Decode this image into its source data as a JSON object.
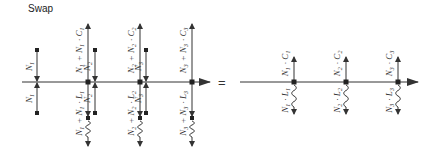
{
  "title": "Swap",
  "equals_sign": "=",
  "colors": {
    "line": "#333333",
    "text": "#333333"
  },
  "left_diagram": {
    "axis": {
      "y": 82,
      "x_start": 22,
      "x_end": 210
    },
    "small_flows": [
      {
        "x": 37,
        "top_label": "N1",
        "bottom_label": "N1"
      },
      {
        "x": 95,
        "top_label": "N2",
        "bottom_label": "N2"
      },
      {
        "x": 146,
        "top_label": "N3",
        "bottom_label": "N3"
      }
    ],
    "main_flows": [
      {
        "x": 88,
        "top_label": "N1 + N1 · C1",
        "bottom_label": "N1 + N1 · L1"
      },
      {
        "x": 140,
        "top_label": "N2 + N2 · C2",
        "bottom_label": "N2 + N2 · L2"
      },
      {
        "x": 192,
        "top_label": "N3 + N3 · C3",
        "bottom_label": "N3 + N3 · L3"
      }
    ]
  },
  "right_diagram": {
    "axis": {
      "y": 82,
      "x_start": 240,
      "x_end": 418
    },
    "flows": [
      {
        "x": 294,
        "top_label": "N1 · C1",
        "bottom_label": "N1 · L1"
      },
      {
        "x": 346,
        "top_label": "N2 · C2",
        "bottom_label": "N2 · L2"
      },
      {
        "x": 398,
        "top_label": "N3 · C3",
        "bottom_label": "N3 · L3"
      }
    ]
  }
}
